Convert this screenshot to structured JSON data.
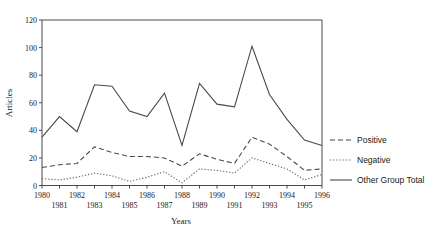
{
  "chart_data": {
    "type": "line",
    "title": "",
    "xlabel": "Years",
    "ylabel": "Articles",
    "x": [
      1980,
      1981,
      1982,
      1983,
      1984,
      1985,
      1986,
      1987,
      1988,
      1989,
      1990,
      1991,
      1992,
      1993,
      1994,
      1995,
      1996
    ],
    "categories": [
      "1980",
      "1981",
      "1982",
      "1983",
      "1984",
      "1985",
      "1986",
      "1987",
      "1988",
      "1989",
      "1990",
      "1991",
      "1992",
      "1993",
      "1994",
      "1995",
      "1996"
    ],
    "xlim": [
      1980,
      1996
    ],
    "ylim": [
      0,
      120
    ],
    "yticks": [
      0,
      20,
      40,
      60,
      80,
      100,
      120
    ],
    "ytick_labels": [
      "0",
      "20",
      "40",
      "60",
      "80",
      "100",
      "120"
    ],
    "xtick_labels_upper": [
      "1980",
      "1982",
      "1984",
      "1986",
      "1988",
      "1990",
      "1992",
      "1994",
      "1996"
    ],
    "xtick_labels_lower": [
      "1981",
      "1983",
      "1985",
      "1987",
      "1989",
      "1991",
      "1993",
      "1995"
    ],
    "grid": false,
    "legend_position": "right",
    "series": [
      {
        "name": "Positive",
        "style": "dashed",
        "color": "#4a4a4a",
        "values": [
          13,
          15,
          16,
          28,
          24,
          21,
          21,
          20,
          14,
          23,
          19,
          16,
          35,
          30,
          21,
          11,
          12
        ]
      },
      {
        "name": "Negative",
        "style": "dotted",
        "color": "#6b6b6b",
        "values": [
          5,
          4,
          6,
          9,
          7,
          3,
          6,
          10,
          2,
          12,
          11,
          9,
          20,
          16,
          12,
          4,
          8
        ]
      },
      {
        "name": "Other Group Total",
        "style": "solid",
        "color": "#4a4a4a",
        "values": [
          35,
          50,
          39,
          73,
          72,
          54,
          50,
          67,
          29,
          74,
          59,
          57,
          101,
          66,
          48,
          33,
          29
        ]
      }
    ]
  },
  "legend": {
    "items": [
      {
        "label": "Positive",
        "style": "dashed"
      },
      {
        "label": "Negative",
        "style": "dotted"
      },
      {
        "label": "Other Group Total",
        "style": "solid"
      }
    ]
  },
  "axes": {
    "y_title": "Articles",
    "x_title": "Years"
  }
}
